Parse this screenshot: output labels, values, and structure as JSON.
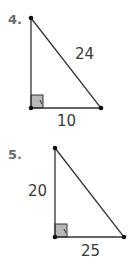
{
  "problems": [
    {
      "number": "4.",
      "labels": {
        "hypotenuse": "24",
        "base": "10"
      },
      "vertices": {
        "top": [
          31,
          18
        ],
        "bottom_left": [
          31,
          108
        ],
        "bottom_right": [
          101,
          108
        ]
      }
    },
    {
      "number": "5.",
      "labels": {
        "leg": "20",
        "base": "25"
      },
      "vertices": {
        "top": [
          55,
          13
        ],
        "bottom_left": [
          55,
          102
        ],
        "bottom_right": [
          124,
          102
        ]
      }
    }
  ],
  "colors": {
    "line": "#333333",
    "right_angle_fill": "#b8b8b8",
    "number": "#6b6b6b"
  }
}
